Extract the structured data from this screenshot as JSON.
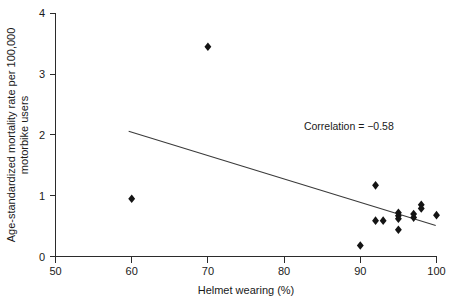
{
  "chart_data": {
    "type": "scatter",
    "title": "",
    "xlabel": "Helmet wearing (%)",
    "ylabel_line1": "Age-standardized mortality rate per 100,000",
    "ylabel_line2": "motorbike users",
    "xlim": [
      50,
      100
    ],
    "ylim": [
      0,
      4
    ],
    "xticks": [
      50,
      60,
      70,
      80,
      90,
      100
    ],
    "yticks": [
      0,
      1,
      2,
      3,
      4
    ],
    "xtick_labels": [
      "50",
      "60",
      "70",
      "80",
      "90",
      "100"
    ],
    "ytick_labels": [
      "0",
      "1",
      "2",
      "3",
      "4"
    ],
    "grid": false,
    "legend": "none",
    "marker_shape": "diamond",
    "marker_color": "#141414",
    "points": [
      {
        "x": 60.0,
        "y": 0.95
      },
      {
        "x": 70.0,
        "y": 3.45
      },
      {
        "x": 90.0,
        "y": 0.18
      },
      {
        "x": 92.0,
        "y": 1.17
      },
      {
        "x": 92.0,
        "y": 0.59
      },
      {
        "x": 93.0,
        "y": 0.59
      },
      {
        "x": 95.0,
        "y": 0.72
      },
      {
        "x": 95.0,
        "y": 0.67
      },
      {
        "x": 95.0,
        "y": 0.62
      },
      {
        "x": 95.0,
        "y": 0.44
      },
      {
        "x": 97.0,
        "y": 0.7
      },
      {
        "x": 97.0,
        "y": 0.64
      },
      {
        "x": 98.0,
        "y": 0.85
      },
      {
        "x": 98.0,
        "y": 0.79
      },
      {
        "x": 100.0,
        "y": 0.68
      }
    ],
    "trend_line": {
      "x_start": 59.6,
      "y_start": 2.06,
      "x_end": 99.9,
      "y_end": 0.51
    },
    "annotations": [
      {
        "text": "Correlation = −0.58",
        "x": 88.5,
        "y": 2.08
      }
    ],
    "correlation": -0.58
  }
}
